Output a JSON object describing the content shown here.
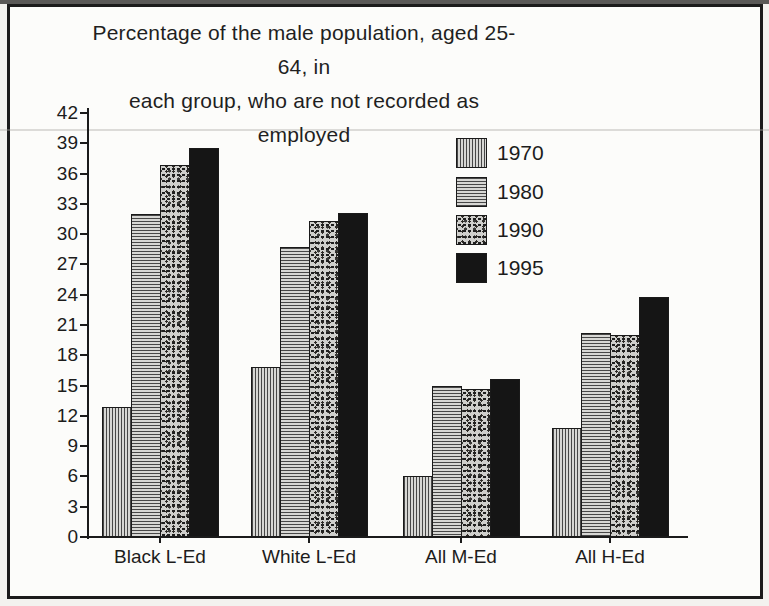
{
  "figure": {
    "title_line1": "Percentage of the male population, aged 25-64, in",
    "title_line2": "each group, who are not recorded as employed"
  },
  "chart_data": {
    "type": "bar",
    "title": "Percentage of the male population, aged 25-64, in each group, who are not recorded as employed",
    "categories": [
      "Black L-Ed",
      "White L-Ed",
      "All M-Ed",
      "All H-Ed"
    ],
    "series": [
      {
        "name": "1970",
        "pattern": "vertical-hatch",
        "values": [
          12.9,
          16.8,
          6.0,
          10.8
        ]
      },
      {
        "name": "1980",
        "pattern": "horizontal-hatch",
        "values": [
          32.0,
          28.7,
          15.0,
          20.2
        ]
      },
      {
        "name": "1990",
        "pattern": "speckle",
        "values": [
          36.8,
          31.3,
          14.7,
          20.0
        ]
      },
      {
        "name": "1995",
        "pattern": "solid-black",
        "values": [
          38.5,
          32.1,
          15.7,
          23.8
        ]
      }
    ],
    "xlabel": "",
    "ylabel": "",
    "ylim": [
      0,
      42
    ],
    "yticks": [
      0,
      3,
      6,
      9,
      12,
      15,
      18,
      21,
      24,
      27,
      30,
      33,
      36,
      39,
      42
    ],
    "grid": false,
    "legend_position": "upper-right-inside",
    "colors": {
      "ink": "#1b1b1b",
      "paper": "#fcfcfa",
      "solid_bar": "#151515"
    }
  }
}
